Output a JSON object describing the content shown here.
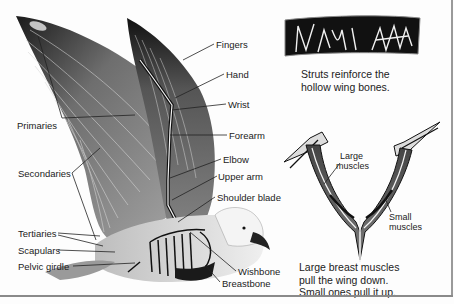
{
  "figure": {
    "wing_labels": {
      "fingers": "Fingers",
      "hand": "Hand",
      "wrist": "Wrist",
      "forearm": "Forearm",
      "elbow": "Elbow",
      "upper_arm": "Upper arm",
      "shoulder_blade": "Shoulder blade",
      "wishbone": "Wishbone",
      "breastbone": "Breastbone",
      "primaries": "Primaries",
      "secondaries": "Secondaries",
      "tertiaries": "Tertiaries",
      "scapulars": "Scapulars",
      "pelvic_girdle": "Pelvic girdle"
    },
    "bone_inset": {
      "caption_line1": "Struts reinforce the",
      "caption_line2": "hollow wing bones."
    },
    "muscle_inset": {
      "large_label_line1": "Large",
      "large_label_line2": "muscles",
      "small_label_line1": "Small",
      "small_label_line2": "muscles",
      "caption_line1": "Large breast muscles",
      "caption_line2": "pull the wing down.",
      "caption_line3": "Small ones pull it up."
    },
    "colors": {
      "ink": "#111111",
      "feather_gray": "#7a7a7a",
      "light_gray": "#cfcfcf",
      "text": "#222222",
      "border": "#9a9a9a"
    }
  }
}
